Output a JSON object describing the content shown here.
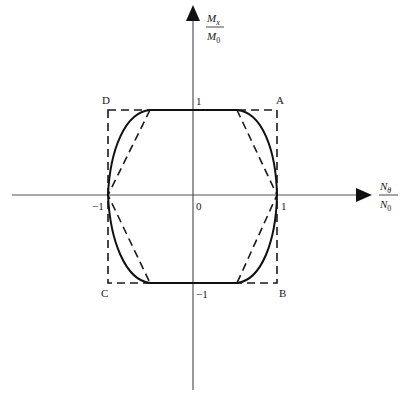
{
  "diagram": {
    "type": "interaction-diagram",
    "axes": {
      "x": {
        "numerator": "N",
        "numerator_sub": "θ",
        "denominator": "N",
        "denominator_sub": "0"
      },
      "y": {
        "numerator": "M",
        "numerator_sub": "x",
        "denominator": "M",
        "denominator_sub": "0"
      }
    },
    "origin_label": "0",
    "tick_labels": {
      "x_pos": "1",
      "x_neg": "−1",
      "y_pos": "1",
      "y_neg": "−1"
    },
    "corner_labels": {
      "A": "A",
      "B": "B",
      "C": "C",
      "D": "D"
    },
    "corners": {
      "A": [
        1,
        1
      ],
      "B": [
        1,
        -1
      ],
      "C": [
        -1,
        -1
      ],
      "D": [
        -1,
        1
      ]
    },
    "flat_segment_half_width": 0.5,
    "curves": [
      {
        "name": "square-limit",
        "style": "dashed",
        "points": [
          [
            -1,
            1
          ],
          [
            1,
            1
          ],
          [
            1,
            -1
          ],
          [
            -1,
            -1
          ]
        ]
      },
      {
        "name": "hexagonal-linear",
        "style": "dashed",
        "points": [
          [
            -0.5,
            1
          ],
          [
            0.5,
            1
          ],
          [
            1,
            0
          ],
          [
            0.5,
            -1
          ],
          [
            -0.5,
            -1
          ],
          [
            -1,
            0
          ]
        ]
      },
      {
        "name": "exact-curved",
        "style": "solid",
        "description": "flat top/bottom from -0.5 to 0.5, curved arcs to (±1,0)"
      }
    ],
    "colors": {
      "line": "#1a1a1a",
      "axis": "#555555"
    }
  }
}
